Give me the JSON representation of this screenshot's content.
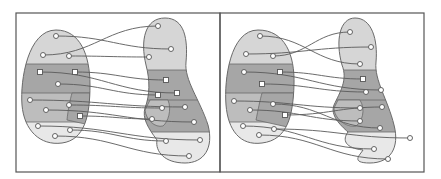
{
  "figure": {
    "colors": {
      "frame": "#555555",
      "blob_outline": "#6a6a6a",
      "light_band": "#d6d6d6",
      "dark_band": "#a6a6a6",
      "mid_band": "#bdbdbd",
      "lightest_band": "#e8e8e8",
      "edge": "#5a5a5a",
      "node_fill": "#ffffff",
      "node_stroke": "#555555"
    }
  },
  "panels": [
    {
      "id": "panel-left",
      "frame": {
        "x": 16,
        "y": 13,
        "w": 204,
        "h": 159
      },
      "left_blob": {
        "outline": "M56,30 C80,30 90,55 90,85 C90,115 85,140 62,143 C40,146 24,130 22,105 C20,80 28,30 56,30 Z",
        "bands": [
          {
            "shade": "light_band",
            "y0": 28,
            "y1": 64
          },
          {
            "shade": "dark_band",
            "y0": 64,
            "y1": 93
          },
          {
            "shade": "mid_band",
            "y0": 93,
            "y1": 122
          },
          {
            "shade": "lightest_band",
            "y0": 122,
            "y1": 148
          }
        ],
        "inner_region": "M72,93 L90,93 L90,125 L67,120 C68,110 70,100 72,93 Z"
      },
      "right_blob": {
        "outline": "M165,18 C185,18 188,40 186,62 C184,80 200,100 208,125 C214,148 204,163 185,163 C165,163 155,152 157,140 C148,128 142,118 145,108 C150,95 150,80 146,65 C140,40 145,18 165,18 Z",
        "bands": [
          {
            "shade": "light_band",
            "y0": 16,
            "y1": 70
          },
          {
            "shade": "dark_band",
            "y0": 70,
            "y1": 100
          },
          {
            "shade": "dark_band",
            "y0": 100,
            "y1": 132
          },
          {
            "shade": "lightest_band",
            "y0": 132,
            "y1": 166
          }
        ],
        "inner_region": "M150,100 L168,100 C172,110 168,122 163,126 C155,128 146,120 145,110 Z"
      },
      "nodes_left": [
        {
          "x": 56,
          "y": 36,
          "shape": "circle"
        },
        {
          "x": 43,
          "y": 55,
          "shape": "circle"
        },
        {
          "x": 69,
          "y": 56,
          "shape": "circle"
        },
        {
          "x": 40,
          "y": 72,
          "shape": "square"
        },
        {
          "x": 75,
          "y": 72,
          "shape": "square"
        },
        {
          "x": 58,
          "y": 84,
          "shape": "circle"
        },
        {
          "x": 30,
          "y": 100,
          "shape": "circle"
        },
        {
          "x": 46,
          "y": 110,
          "shape": "circle"
        },
        {
          "x": 69,
          "y": 105,
          "shape": "circle"
        },
        {
          "x": 80,
          "y": 116,
          "shape": "square"
        },
        {
          "x": 38,
          "y": 126,
          "shape": "circle"
        },
        {
          "x": 70,
          "y": 130,
          "shape": "circle"
        },
        {
          "x": 55,
          "y": 136,
          "shape": "circle"
        }
      ],
      "nodes_right": [
        {
          "x": 158,
          "y": 26,
          "shape": "circle"
        },
        {
          "x": 171,
          "y": 49,
          "shape": "circle"
        },
        {
          "x": 149,
          "y": 57,
          "shape": "circle"
        },
        {
          "x": 166,
          "y": 80,
          "shape": "square"
        },
        {
          "x": 177,
          "y": 93,
          "shape": "square"
        },
        {
          "x": 158,
          "y": 95,
          "shape": "square"
        },
        {
          "x": 162,
          "y": 108,
          "shape": "circle"
        },
        {
          "x": 185,
          "y": 107,
          "shape": "circle"
        },
        {
          "x": 152,
          "y": 119,
          "shape": "circle"
        },
        {
          "x": 194,
          "y": 122,
          "shape": "circle"
        },
        {
          "x": 166,
          "y": 141,
          "shape": "circle"
        },
        {
          "x": 200,
          "y": 140,
          "shape": "circle"
        },
        {
          "x": 189,
          "y": 156,
          "shape": "circle"
        }
      ],
      "edges": [
        [
          0,
          1
        ],
        [
          1,
          0
        ],
        [
          2,
          2
        ],
        [
          3,
          4
        ],
        [
          4,
          3
        ],
        [
          5,
          5
        ],
        [
          6,
          7
        ],
        [
          7,
          9
        ],
        [
          8,
          6
        ],
        [
          9,
          8
        ],
        [
          10,
          11
        ],
        [
          11,
          10
        ],
        [
          12,
          12
        ]
      ]
    },
    {
      "id": "panel-right",
      "frame": {
        "x": 220,
        "y": 13,
        "w": 204,
        "h": 159
      },
      "left_blob": {
        "outline": "M258,30 C285,30 295,55 294,85 C293,115 288,140 262,143 C240,146 228,130 226,105 C224,80 230,30 258,30 Z",
        "bands": [
          {
            "shade": "light_band",
            "y0": 28,
            "y1": 64
          },
          {
            "shade": "dark_band",
            "y0": 64,
            "y1": 93
          },
          {
            "shade": "mid_band",
            "y0": 93,
            "y1": 122
          },
          {
            "shade": "lightest_band",
            "y0": 122,
            "y1": 148
          }
        ],
        "inner_region": "M262,93 L294,93 L292,128 L256,120 C258,110 260,100 262,93 Z"
      },
      "right_blob": {
        "outline": "M355,18 C372,18 378,40 376,62 C374,80 388,100 394,125 C400,148 390,163 370,163 C350,163 360,155 363,150 C345,148 342,140 348,132 C340,125 330,115 334,105 C340,92 348,80 342,65 C335,40 340,18 355,18 Z",
        "bands": [
          {
            "shade": "light_band",
            "y0": 16,
            "y1": 70
          },
          {
            "shade": "dark_band",
            "y0": 70,
            "y1": 100
          },
          {
            "shade": "dark_band",
            "y0": 100,
            "y1": 132
          },
          {
            "shade": "lightest_band",
            "y0": 132,
            "y1": 166
          }
        ],
        "inner_region": "M338,100 L360,100 C366,110 362,122 356,126 C346,128 334,118 334,108 Z"
      },
      "nodes_left": [
        {
          "x": 260,
          "y": 36,
          "shape": "circle"
        },
        {
          "x": 246,
          "y": 54,
          "shape": "circle"
        },
        {
          "x": 273,
          "y": 56,
          "shape": "circle"
        },
        {
          "x": 244,
          "y": 72,
          "shape": "circle"
        },
        {
          "x": 280,
          "y": 72,
          "shape": "square"
        },
        {
          "x": 262,
          "y": 84,
          "shape": "square"
        },
        {
          "x": 234,
          "y": 101,
          "shape": "circle"
        },
        {
          "x": 250,
          "y": 110,
          "shape": "circle"
        },
        {
          "x": 273,
          "y": 104,
          "shape": "circle"
        },
        {
          "x": 285,
          "y": 115,
          "shape": "square"
        },
        {
          "x": 243,
          "y": 126,
          "shape": "circle"
        },
        {
          "x": 274,
          "y": 129,
          "shape": "circle"
        },
        {
          "x": 259,
          "y": 135,
          "shape": "circle"
        }
      ],
      "nodes_right": [
        {
          "x": 350,
          "y": 32,
          "shape": "circle"
        },
        {
          "x": 371,
          "y": 47,
          "shape": "circle"
        },
        {
          "x": 360,
          "y": 64,
          "shape": "circle"
        },
        {
          "x": 363,
          "y": 79,
          "shape": "square"
        },
        {
          "x": 381,
          "y": 90,
          "shape": "circle"
        },
        {
          "x": 366,
          "y": 92,
          "shape": "circle"
        },
        {
          "x": 360,
          "y": 108,
          "shape": "circle"
        },
        {
          "x": 382,
          "y": 107,
          "shape": "circle"
        },
        {
          "x": 360,
          "y": 121,
          "shape": "circle"
        },
        {
          "x": 380,
          "y": 128,
          "shape": "circle"
        },
        {
          "x": 374,
          "y": 149,
          "shape": "circle"
        },
        {
          "x": 410,
          "y": 138,
          "shape": "circle"
        },
        {
          "x": 388,
          "y": 159,
          "shape": "circle"
        }
      ],
      "edges": [
        [
          0,
          2
        ],
        [
          1,
          1
        ],
        [
          2,
          0
        ],
        [
          3,
          4
        ],
        [
          4,
          3
        ],
        [
          5,
          5
        ],
        [
          6,
          6
        ],
        [
          7,
          8
        ],
        [
          8,
          9
        ],
        [
          9,
          7
        ],
        [
          10,
          10
        ],
        [
          11,
          11
        ],
        [
          12,
          12
        ]
      ]
    }
  ]
}
